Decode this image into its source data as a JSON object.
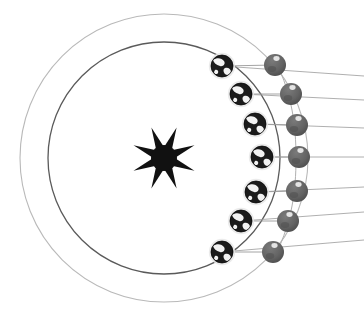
{
  "figure": {
    "name": "sun-earth-moon-orbit-diagram",
    "background_color": "#ffffff",
    "width": 364,
    "height": 316
  },
  "sun": {
    "name": "sun",
    "center_x": 164,
    "center_y": 158,
    "core_radius": 13,
    "ray_count": 8,
    "ray_length": 33,
    "ray_half_width": 6,
    "rotation_deg": 22.5,
    "color": "#111111"
  },
  "orbits": {
    "outer": {
      "name": "outer-orbit-circle",
      "center_x": 164,
      "center_y": 158,
      "radius": 144,
      "stroke": "#b9b9b9",
      "stroke_width": 1.1
    },
    "inner": {
      "name": "inner-orbit-circle",
      "center_x": 164,
      "center_y": 158,
      "radius": 116,
      "stroke": "#5a5a5a",
      "stroke_width": 1.3
    },
    "moon_path": {
      "name": "moon-orbit-arc",
      "stroke": "#b0b0b0",
      "stroke_width": 1.0,
      "path": "M 276,62 C 292,95 296,125 296,158 C 296,191 292,221 276,254"
    }
  },
  "sight_lines": {
    "name": "sight-line",
    "stroke": "#9a9a9a",
    "stroke_width": 0.8,
    "right_edge_x": 364
  },
  "earth_style": {
    "radius": 11,
    "ocean_color": "#1b1b1b",
    "land_color": "#f2f2f2",
    "halo_color": "#e8e8e8"
  },
  "moon_style": {
    "radius": 11,
    "body_color": "#636363",
    "shade_color": "#4e4e4e",
    "highlight_color": "#eeeeee",
    "connector_stroke": "#9a9a9a",
    "connector_width": 0.9
  },
  "pairs": [
    {
      "index": 1,
      "label": "position-1",
      "earth": {
        "x": 222,
        "y": 66
      },
      "moon": {
        "x": 275,
        "y": 65
      },
      "line_end_y": 76
    },
    {
      "index": 2,
      "label": "position-2",
      "earth": {
        "x": 241,
        "y": 94
      },
      "moon": {
        "x": 291,
        "y": 94
      },
      "line_end_y": 100
    },
    {
      "index": 3,
      "label": "position-3",
      "earth": {
        "x": 255,
        "y": 124
      },
      "moon": {
        "x": 297,
        "y": 125
      },
      "line_end_y": 128
    },
    {
      "index": 4,
      "label": "position-4",
      "earth": {
        "x": 262,
        "y": 157
      },
      "moon": {
        "x": 299,
        "y": 157
      },
      "line_end_y": 157
    },
    {
      "index": 5,
      "label": "position-5",
      "earth": {
        "x": 256,
        "y": 192
      },
      "moon": {
        "x": 297,
        "y": 191
      },
      "line_end_y": 187
    },
    {
      "index": 6,
      "label": "position-6",
      "earth": {
        "x": 241,
        "y": 221
      },
      "moon": {
        "x": 288,
        "y": 221
      },
      "line_end_y": 212
    },
    {
      "index": 7,
      "label": "position-7",
      "earth": {
        "x": 222,
        "y": 252
      },
      "moon": {
        "x": 273,
        "y": 252
      },
      "line_end_y": 240
    }
  ]
}
